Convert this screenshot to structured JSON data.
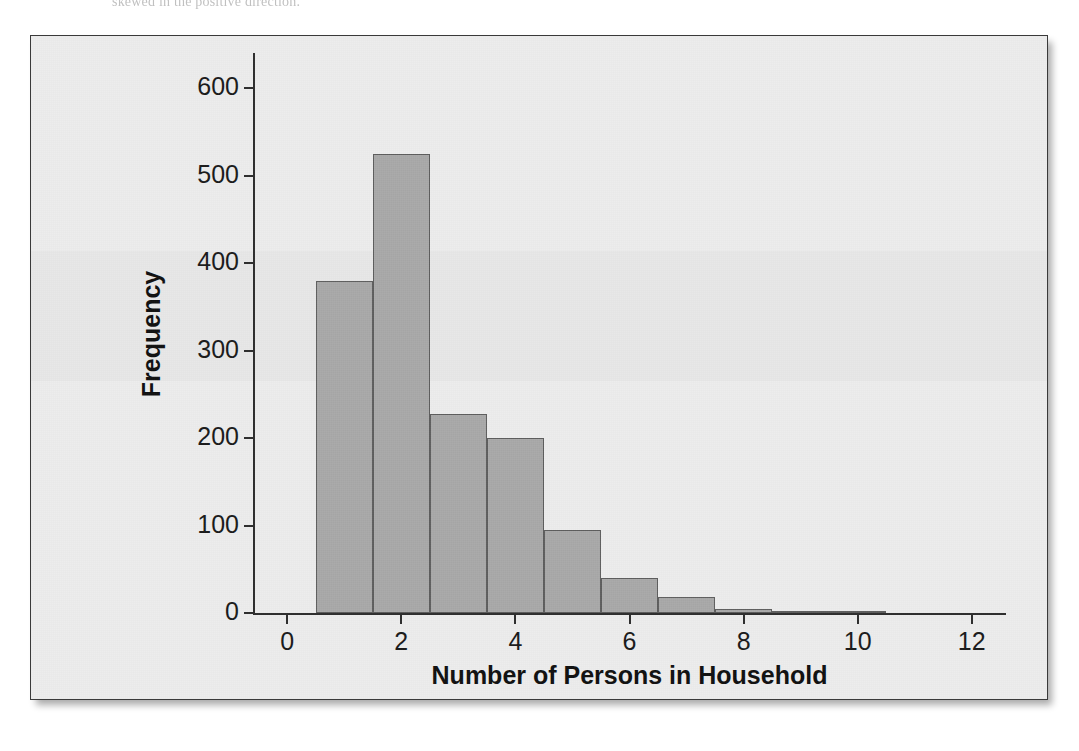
{
  "page": {
    "caption_text": "skewed in the positive direction."
  },
  "figure": {
    "background_color": "#ededed",
    "border_color": "#3a3a3a",
    "bar_fill_color": "#a9a9a9",
    "bar_border_color": "#5e5e5e",
    "axis_color": "#2e2e2e"
  },
  "chart_data": {
    "type": "bar",
    "title": "",
    "subtitle": "",
    "xlabel": "Number of Persons in Household",
    "ylabel": "Frequency",
    "xlim": [
      -0.6,
      12.6
    ],
    "ylim": [
      0,
      640
    ],
    "grid": false,
    "legend": false,
    "bin_width": 1,
    "x_ticks": [
      0,
      2,
      4,
      6,
      8,
      10,
      12
    ],
    "x_tick_labels": [
      "0",
      "2",
      "4",
      "6",
      "8",
      "10",
      "12"
    ],
    "y_ticks": [
      0,
      100,
      200,
      300,
      400,
      500,
      600
    ],
    "y_tick_labels": [
      "0",
      "100",
      "200",
      "300",
      "400",
      "500",
      "600"
    ],
    "bins": [
      {
        "label": "1",
        "left": 0.5,
        "right": 1.5,
        "value": 380
      },
      {
        "label": "2",
        "left": 1.5,
        "right": 2.5,
        "value": 525
      },
      {
        "label": "3",
        "left": 2.5,
        "right": 3.5,
        "value": 227
      },
      {
        "label": "4",
        "left": 3.5,
        "right": 4.5,
        "value": 200
      },
      {
        "label": "5",
        "left": 4.5,
        "right": 5.5,
        "value": 95
      },
      {
        "label": "6",
        "left": 5.5,
        "right": 6.5,
        "value": 40
      },
      {
        "label": "7",
        "left": 6.5,
        "right": 7.5,
        "value": 18
      },
      {
        "label": "8",
        "left": 7.5,
        "right": 8.5,
        "value": 5
      },
      {
        "label": "9",
        "left": 8.5,
        "right": 9.5,
        "value": 2
      },
      {
        "label": "10",
        "left": 9.5,
        "right": 10.5,
        "value": 2
      }
    ],
    "categories": [
      "1",
      "2",
      "3",
      "4",
      "5",
      "6",
      "7",
      "8",
      "9",
      "10"
    ],
    "values": [
      380,
      525,
      227,
      200,
      95,
      40,
      18,
      5,
      2,
      2
    ]
  }
}
